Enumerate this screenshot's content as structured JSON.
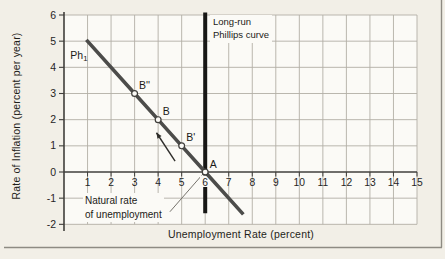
{
  "figure": {
    "bg": "#f2efe7",
    "plot_bg": "#fbfaf6",
    "grid_color": "#b2afa6",
    "axis_color": "#403f3c",
    "text_color": "#26251f",
    "border_color": "#8e8b83"
  },
  "chart_data": {
    "type": "line",
    "title": "",
    "xlabel": "Unemployment Rate (percent)",
    "ylabel": "Rate of Inflation (percent per year)",
    "xlim": [
      0,
      15
    ],
    "ylim": [
      -2,
      6
    ],
    "xticks": [
      1,
      2,
      3,
      4,
      5,
      6,
      7,
      8,
      9,
      10,
      11,
      12,
      13,
      14,
      15
    ],
    "yticks": [
      6,
      5,
      4,
      3,
      2,
      1,
      0,
      -1,
      -2
    ],
    "grid": true,
    "series": [
      {
        "name": "short-run-phillips-curve",
        "label": "Ph",
        "label_subscript": "1",
        "label_x": 0.27,
        "label_y": 4.32,
        "equation": "inflation = 6 - unemployment",
        "points": [
          [
            0.95,
            5.05
          ],
          [
            3,
            3
          ],
          [
            4,
            2
          ],
          [
            5,
            1
          ],
          [
            6,
            0
          ],
          [
            7.62,
            -1.62
          ]
        ],
        "color": "#4c4c4a",
        "width": 3.6
      },
      {
        "name": "long-run-phillips-curve",
        "label": "Long-run Phillips curve",
        "x": 6,
        "y_start": 6.1,
        "y_end": -1.58,
        "color": "#171715",
        "width": 4
      }
    ],
    "points": [
      {
        "label": "B''",
        "x": 3,
        "y": 3
      },
      {
        "label": "B",
        "x": 4,
        "y": 2
      },
      {
        "label": "B'",
        "x": 5,
        "y": 1
      },
      {
        "label": "A",
        "x": 6,
        "y": 0
      }
    ],
    "annotations": {
      "long_run_label": {
        "line1": "Long-run",
        "line2": "Phillips curve"
      },
      "natural_rate_label": {
        "line1": "Natural rate",
        "line2": "of unemployment",
        "leader_from": [
          4.5,
          -1.52
        ],
        "leader_to": [
          5.93,
          -0.05
        ]
      },
      "direction_arrow": {
        "from": [
          4.72,
          0.42
        ],
        "to": [
          3.93,
          1.5
        ]
      }
    }
  }
}
